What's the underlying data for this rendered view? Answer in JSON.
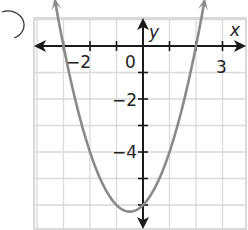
{
  "chart_data": {
    "type": "line",
    "title": "",
    "xlabel": "x",
    "ylabel": "y",
    "function": "y = x^2 + x - 6",
    "xlim": [
      -4,
      3.8
    ],
    "ylim": [
      -7,
      1
    ],
    "grid": true,
    "x_tick_labels": [
      {
        "value": -2,
        "label": "−2"
      },
      {
        "value": 0,
        "label": "0"
      },
      {
        "value": 3,
        "label": "3"
      }
    ],
    "y_tick_labels": [
      {
        "value": -2,
        "label": "−2"
      },
      {
        "value": -4,
        "label": "−4"
      }
    ],
    "series": [
      {
        "name": "parabola",
        "x": [
          -3.35,
          -3,
          -2.5,
          -2,
          -1.5,
          -1,
          -0.5,
          0,
          0.5,
          1,
          1.5,
          2,
          2.35
        ],
        "y": [
          1.87,
          0,
          -2.25,
          -4,
          -5.25,
          -6,
          -6.25,
          -6,
          -5.25,
          -4,
          -2.25,
          0,
          1.87
        ]
      }
    ],
    "key_points": {
      "x_intercepts": [
        -3,
        2
      ],
      "y_intercept": -6,
      "vertex": [
        -0.5,
        -6.25
      ]
    },
    "colors": {
      "curve": "#8a8a8a",
      "axes": "#1a1a1a",
      "grid": "#d9d9d9"
    }
  },
  "labels": {
    "x_axis": "x",
    "y_axis": "y",
    "tick_neg2_x": "−2",
    "tick_0": "0",
    "tick_3": "3",
    "tick_neg2_y": "−2",
    "tick_neg4_y": "−4"
  }
}
